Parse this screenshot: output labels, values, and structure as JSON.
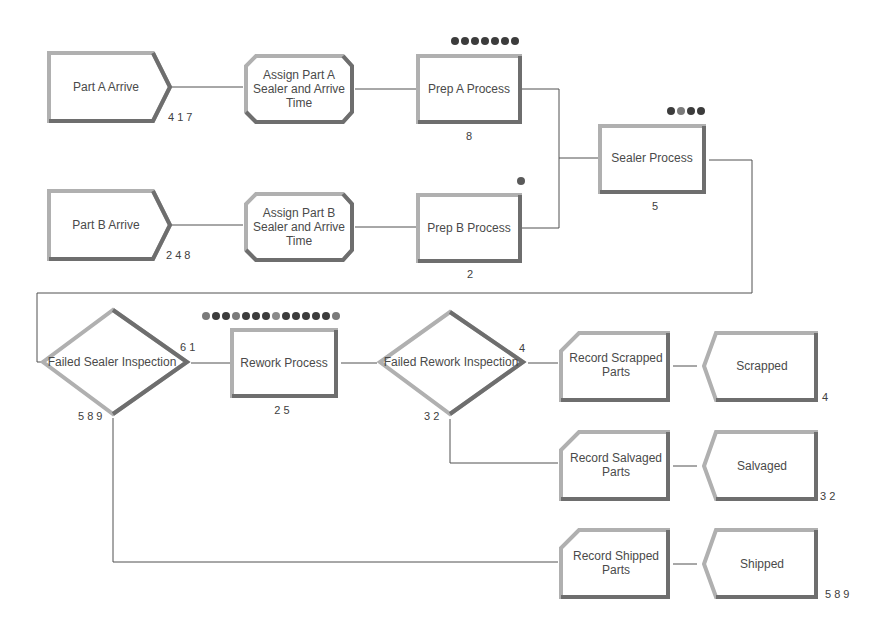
{
  "modules": {
    "part_a_arrive": {
      "label": "Part A Arrive",
      "count": "4 1 7"
    },
    "assign_part_a": {
      "label_lines": [
        "Assign Part A",
        "Sealer and Arrive",
        "Time"
      ]
    },
    "prep_a_process": {
      "label": "Prep A Process",
      "count": "8",
      "queue_length": 7
    },
    "sealer_process": {
      "label": "Sealer Process",
      "count": "5",
      "queue_length": 4
    },
    "part_b_arrive": {
      "label": "Part B Arrive",
      "count": "2 4 8"
    },
    "assign_part_b": {
      "label_lines": [
        "Assign Part B",
        "Sealer and Arrive",
        "Time"
      ]
    },
    "prep_b_process": {
      "label": "Prep B Process",
      "count": "2",
      "queue_length": 1
    },
    "failed_sealer_inspection": {
      "label": "Failed Sealer Inspection",
      "true_count": "6 1",
      "false_count": "5 8 9"
    },
    "rework_process": {
      "label": "Rework Process",
      "count": "2 5",
      "queue_length": 13
    },
    "failed_rework_inspection": {
      "label": "Failed Rework Inspection",
      "true_count": "4",
      "false_count": "3 2"
    },
    "record_scrapped": {
      "label_lines": [
        "Record Scrapped",
        "Parts"
      ]
    },
    "scrapped": {
      "label": "Scrapped",
      "count": "4"
    },
    "record_salvaged": {
      "label_lines": [
        "Record Salvaged",
        "Parts"
      ]
    },
    "salvaged": {
      "label": "Salvaged",
      "count": "3 2"
    },
    "record_shipped": {
      "label_lines": [
        "Record Shipped",
        "Parts"
      ]
    },
    "shipped": {
      "label": "Shipped",
      "count": "5 8 9"
    }
  },
  "colors": {
    "module_border_light": "#b8b8b8",
    "module_border_dark": "#6e6e6e",
    "connector": "#505050",
    "entity_dark": "#3c3c3c",
    "entity_mid": "#7a7a7a"
  }
}
